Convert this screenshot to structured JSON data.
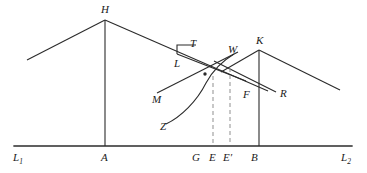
{
  "figure": {
    "kind": "geometric-line-diagram",
    "background_color": "#ffffff",
    "stroke_color": "#2b2b2b",
    "dashed_color": "#8c8c8c",
    "baseline": {
      "name": "horizontal-axis",
      "left_label": "L",
      "left_sub": "1",
      "right_label": "L",
      "right_sub": "2",
      "x_start": 14,
      "x_end": 352,
      "y": 146
    },
    "labels": [
      {
        "id": "H",
        "text": "H",
        "sub": "",
        "x": 101,
        "y": 6,
        "name": "point-label-H"
      },
      {
        "id": "T",
        "text": "T",
        "sub": "",
        "x": 189,
        "y": 39,
        "name": "point-label-T"
      },
      {
        "id": "W",
        "text": "W",
        "sub": "",
        "x": 228,
        "y": 46,
        "name": "point-label-W"
      },
      {
        "id": "K",
        "text": "K",
        "sub": "",
        "x": 255,
        "y": 36,
        "name": "point-label-K"
      },
      {
        "id": "L",
        "text": "L",
        "sub": "",
        "x": 174,
        "y": 59,
        "name": "point-label-L"
      },
      {
        "id": "F",
        "text": "F",
        "sub": "",
        "x": 242,
        "y": 90,
        "name": "point-label-F"
      },
      {
        "id": "R",
        "text": "R",
        "sub": "",
        "x": 279,
        "y": 89,
        "name": "point-label-R"
      },
      {
        "id": "M",
        "text": "M",
        "sub": "",
        "x": 152,
        "y": 95,
        "name": "point-label-M"
      },
      {
        "id": "Z",
        "text": "Z",
        "sub": "",
        "x": 160,
        "y": 122,
        "name": "point-label-Z"
      },
      {
        "id": "L1",
        "text": "L",
        "sub": "1",
        "x": 14,
        "y": 152,
        "name": "axis-label-L1"
      },
      {
        "id": "A",
        "text": "A",
        "sub": "",
        "x": 101,
        "y": 152,
        "name": "axis-label-A"
      },
      {
        "id": "G",
        "text": "G",
        "sub": "",
        "x": 192,
        "y": 152,
        "name": "axis-label-G"
      },
      {
        "id": "E",
        "text": "E",
        "sub": "",
        "x": 209,
        "y": 152,
        "name": "axis-label-E"
      },
      {
        "id": "Ep",
        "text": "E′",
        "sub": "",
        "x": 222,
        "y": 152,
        "name": "axis-label-E-prime"
      },
      {
        "id": "B",
        "text": "B",
        "sub": "",
        "x": 251,
        "y": 152,
        "name": "axis-label-B"
      },
      {
        "id": "L2",
        "text": "L",
        "sub": "2",
        "x": 342,
        "y": 152,
        "name": "axis-label-L2"
      }
    ],
    "paths": {
      "h_left_slope": "M 27 60 L 105 20",
      "h_right_slope": "M 105 20 L 268 91",
      "h_vertical": "M 105 20 L 105 146",
      "k_left_slope": "M 225 70 L 259 50",
      "k_right_slope": "M 259 50 L 340 90",
      "k_vertical": "M 259 50 L 259 146",
      "l_t_riser": "M 176 53 L 176 45 L 196 45",
      "t_to_w_line": "M 176 53 L 245 80",
      "m_to_w_line": "M 158 93 L 237 53",
      "w_to_r_line": "M 215 62 L 275 91",
      "z_curve": "M 165 124 C 180 116 196 100 205 82 C 212 70 222 60 233 54",
      "dashed_e": "M 213 76 L 213 146",
      "dashed_eprime": "M 230 68 L 230 146"
    },
    "dots": [
      {
        "x": 205,
        "y": 74,
        "name": "intersection-dot-1"
      }
    ]
  }
}
